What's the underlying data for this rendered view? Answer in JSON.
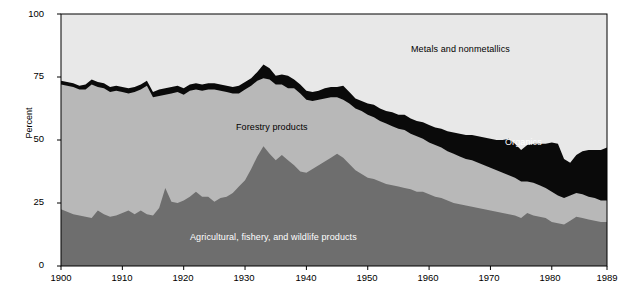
{
  "chart_data": {
    "type": "area",
    "title": "",
    "subtitle": "",
    "xlabel": "",
    "ylabel": "Percent",
    "ylim": [
      0,
      100
    ],
    "xlim": [
      1900,
      1989
    ],
    "grid": false,
    "legend_position": "inline-annotations",
    "stacked": true,
    "yticks": [
      "0",
      "25",
      "50",
      "75",
      "100"
    ],
    "xticks": [
      "1900",
      "1910",
      "1920",
      "1930",
      "1940",
      "1950",
      "1960",
      "1970",
      "1980",
      "1989"
    ],
    "annotations": [
      {
        "text": "Metals and nonmetallics",
        "x": 1972,
        "y": 88,
        "color": "#000000"
      },
      {
        "text": "Forestry products",
        "x": 1930,
        "y": 56,
        "color": "#000000"
      },
      {
        "text": "Organics",
        "x": 1976,
        "y": 47,
        "color": "#ffffff"
      },
      {
        "text": "Agricultural, fishery, and wildlife products",
        "x": 1942,
        "y": 9,
        "color": "#ffffff"
      }
    ],
    "colors": {
      "agricultural": "#6e6e6e",
      "forestry": "#b8b8b8",
      "organics_band": "#0a0a0a",
      "metals": "#e8e8e8",
      "axis": "#000000",
      "background": "#ffffff"
    },
    "series": [
      {
        "name": "Agricultural, fishery, and wildlife products",
        "color": "#6e6e6e",
        "values": [
          22.5,
          21.5,
          20.5,
          20.0,
          19.5,
          19.0,
          22.0,
          20.5,
          19.5,
          20.0,
          21.0,
          22.0,
          20.5,
          22.0,
          20.5,
          20.0,
          23.0,
          31.0,
          25.5,
          25.0,
          26.0,
          27.5,
          29.5,
          27.5,
          27.5,
          25.5,
          27.0,
          27.5,
          29.0,
          31.5,
          34.0,
          38.5,
          43.5,
          47.5,
          44.5,
          42.0,
          44.0,
          42.0,
          40.0,
          37.5,
          37.0,
          38.5,
          40.0,
          41.5,
          43.0,
          44.5,
          43.0,
          40.5,
          38.0,
          36.5,
          35.0,
          34.5,
          33.5,
          32.5,
          32.0,
          31.5,
          31.0,
          30.5,
          29.5,
          29.5,
          28.5,
          27.5,
          27.0,
          26.0,
          25.0,
          24.5,
          24.0,
          23.5,
          23.0,
          22.5,
          22.0,
          21.5,
          21.0,
          20.5,
          20.0,
          19.0,
          21.0,
          20.0,
          19.5,
          19.0,
          17.5,
          17.0,
          16.5,
          18.0,
          19.5,
          19.0,
          18.5,
          18.0,
          17.5,
          17.5
        ]
      },
      {
        "name": "Forestry products",
        "color": "#b8b8b8",
        "values": [
          49.5,
          50.0,
          50.5,
          50.0,
          50.5,
          53.0,
          49.0,
          50.0,
          49.5,
          49.5,
          48.0,
          46.5,
          48.5,
          48.0,
          51.0,
          47.0,
          44.5,
          37.0,
          43.0,
          44.0,
          42.0,
          42.0,
          40.5,
          42.0,
          42.5,
          44.5,
          42.5,
          41.5,
          39.5,
          37.0,
          36.0,
          33.0,
          30.0,
          27.0,
          29.5,
          30.0,
          28.0,
          28.5,
          30.5,
          31.0,
          29.0,
          27.0,
          26.0,
          25.0,
          24.0,
          22.5,
          23.0,
          24.0,
          24.5,
          25.0,
          25.0,
          24.5,
          24.0,
          24.0,
          23.5,
          23.0,
          23.0,
          22.0,
          22.0,
          21.0,
          20.5,
          20.5,
          20.0,
          19.5,
          19.5,
          19.0,
          18.5,
          18.5,
          18.0,
          17.5,
          17.0,
          16.5,
          16.0,
          15.5,
          15.0,
          14.5,
          12.5,
          13.0,
          12.5,
          12.0,
          12.0,
          11.0,
          10.5,
          10.0,
          9.5,
          9.5,
          9.0,
          9.0,
          8.5,
          8.5
        ]
      },
      {
        "name": "Organics",
        "color": "#0a0a0a",
        "values": [
          1.5,
          1.5,
          1.5,
          1.5,
          2.0,
          2.0,
          2.0,
          2.0,
          2.0,
          2.0,
          2.0,
          2.0,
          2.0,
          2.0,
          2.0,
          2.0,
          2.5,
          2.5,
          2.5,
          2.5,
          2.5,
          2.5,
          2.5,
          2.5,
          2.5,
          2.5,
          2.5,
          2.5,
          2.5,
          3.0,
          3.0,
          3.0,
          3.5,
          5.5,
          4.5,
          3.5,
          4.0,
          5.0,
          3.5,
          3.5,
          3.5,
          3.5,
          3.5,
          4.0,
          4.0,
          4.0,
          5.5,
          4.5,
          4.0,
          4.0,
          4.5,
          5.0,
          5.0,
          5.0,
          5.5,
          5.5,
          6.0,
          6.0,
          6.0,
          6.5,
          7.0,
          7.0,
          7.5,
          8.0,
          8.5,
          9.0,
          9.5,
          10.0,
          10.5,
          11.0,
          11.5,
          12.0,
          13.0,
          14.5,
          13.5,
          12.5,
          14.5,
          15.5,
          16.5,
          17.5,
          19.5,
          20.5,
          15.5,
          13.0,
          15.0,
          17.0,
          18.5,
          19.0,
          20.0,
          21.0
        ]
      },
      {
        "name": "Metals and nonmetallics",
        "color": "#e8e8e8",
        "values": [
          26.5,
          27.0,
          27.5,
          28.5,
          28.0,
          26.0,
          27.0,
          27.5,
          29.0,
          28.5,
          29.0,
          29.5,
          29.0,
          28.0,
          26.5,
          31.0,
          30.0,
          29.5,
          29.0,
          28.5,
          29.5,
          28.0,
          27.5,
          28.0,
          27.5,
          27.5,
          28.0,
          28.5,
          29.0,
          28.5,
          27.0,
          25.5,
          23.0,
          20.0,
          21.5,
          24.5,
          24.0,
          24.5,
          26.0,
          28.0,
          30.5,
          31.0,
          30.5,
          29.5,
          29.0,
          29.0,
          28.5,
          31.0,
          33.5,
          34.5,
          35.5,
          36.0,
          37.5,
          38.5,
          39.0,
          40.0,
          40.0,
          41.5,
          42.5,
          43.0,
          44.0,
          45.0,
          45.5,
          46.5,
          47.0,
          47.5,
          48.0,
          48.0,
          48.5,
          49.0,
          49.5,
          50.0,
          50.0,
          49.5,
          51.5,
          54.0,
          52.0,
          51.5,
          51.5,
          51.5,
          51.0,
          51.5,
          57.5,
          59.0,
          56.0,
          54.5,
          54.0,
          54.0,
          54.0,
          53.0
        ]
      }
    ]
  },
  "axes": {
    "yticks": [
      {
        "label": "100",
        "value": 100
      },
      {
        "label": "75",
        "value": 75
      },
      {
        "label": "50",
        "value": 50
      },
      {
        "label": "25",
        "value": 25
      },
      {
        "label": "0",
        "value": 0
      }
    ],
    "ylabel": "Percent",
    "xticks": [
      {
        "label": "1900",
        "value": 1900
      },
      {
        "label": "1910",
        "value": 1910
      },
      {
        "label": "1920",
        "value": 1920
      },
      {
        "label": "1930",
        "value": 1930
      },
      {
        "label": "1940",
        "value": 1940
      },
      {
        "label": "1950",
        "value": 1950
      },
      {
        "label": "1960",
        "value": 1960
      },
      {
        "label": "1970",
        "value": 1970
      },
      {
        "label": "1980",
        "value": 1980
      },
      {
        "label": "1989",
        "value": 1989
      }
    ]
  },
  "labels": {
    "metals": "Metals and nonmetallics",
    "forestry": "Forestry products",
    "organics": "Organics",
    "agricultural": "Agricultural, fishery, and wildlife products"
  }
}
